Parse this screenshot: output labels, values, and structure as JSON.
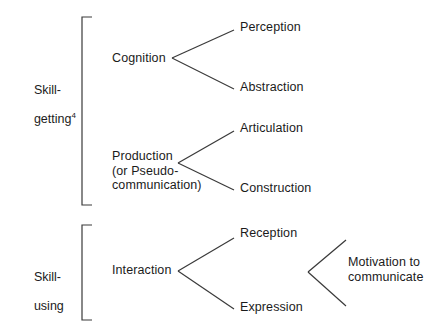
{
  "diagram": {
    "line_color": "#3a3a3a",
    "text_color": "#1b1b1b",
    "background_color": "#ffffff",
    "groups": [
      {
        "id": "skill-getting",
        "label_line1": "Skill-",
        "label_line2": "getting",
        "footnote_marker": "4",
        "bracket": {
          "x": 82,
          "top": 17,
          "bottom": 205,
          "arm": 10
        }
      },
      {
        "id": "skill-using",
        "label_line1": "Skill-",
        "label_line2": "using",
        "footnote_marker": "",
        "bracket": {
          "x": 82,
          "top": 225,
          "bottom": 320,
          "arm": 10
        }
      }
    ],
    "nodes": [
      {
        "id": "cognition",
        "label": "Cognition",
        "x": 112,
        "y": 51
      },
      {
        "id": "production",
        "label": "Production\n(or Pseudo-\ncommunication)",
        "x": 112,
        "y": 149
      },
      {
        "id": "interaction",
        "label": "Interaction",
        "x": 112,
        "y": 263
      },
      {
        "id": "perception",
        "label": "Perception",
        "x": 240,
        "y": 20
      },
      {
        "id": "abstraction",
        "label": "Abstraction",
        "x": 240,
        "y": 80
      },
      {
        "id": "articulation",
        "label": "Articulation",
        "x": 240,
        "y": 121
      },
      {
        "id": "construction",
        "label": "Construction",
        "x": 240,
        "y": 181
      },
      {
        "id": "reception",
        "label": "Reception",
        "x": 240,
        "y": 226
      },
      {
        "id": "expression",
        "label": "Expression",
        "x": 240,
        "y": 300
      },
      {
        "id": "motivation",
        "label": "Motivation to\ncommunicate",
        "x": 348,
        "y": 255
      }
    ],
    "branches": [
      {
        "id": "cognition-to-perception",
        "from": [
          172,
          58
        ],
        "to": [
          234,
          30
        ]
      },
      {
        "id": "cognition-to-abstraction",
        "from": [
          172,
          58
        ],
        "to": [
          234,
          89
        ]
      },
      {
        "id": "production-to-articulation",
        "from": [
          178,
          163
        ],
        "to": [
          234,
          131
        ]
      },
      {
        "id": "production-to-construction",
        "from": [
          178,
          163
        ],
        "to": [
          234,
          190
        ]
      },
      {
        "id": "interaction-to-reception",
        "from": [
          178,
          271
        ],
        "to": [
          234,
          238
        ]
      },
      {
        "id": "interaction-to-expression",
        "from": [
          178,
          271
        ],
        "to": [
          234,
          309
        ]
      },
      {
        "id": "motivation-upper-arm",
        "from": [
          308,
          272
        ],
        "to": [
          346,
          240
        ]
      },
      {
        "id": "motivation-lower-arm",
        "from": [
          308,
          272
        ],
        "to": [
          346,
          306
        ]
      }
    ]
  }
}
